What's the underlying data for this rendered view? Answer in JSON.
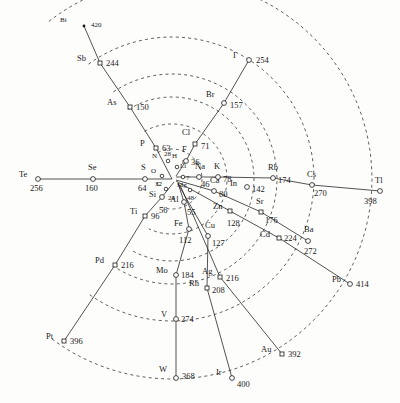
{
  "figure": {
    "type": "radial-spiral-periodic-system",
    "background": "#fdfdfc",
    "ink": "#1b1b1b",
    "width": 400,
    "height": 403,
    "center": {
      "x": 172,
      "y": 179
    }
  },
  "chart_data": {
    "type": "scatter",
    "title": "",
    "xlabel": "",
    "ylabel": "",
    "value_field": "atomic_weight",
    "points": [
      {
        "symbol": "Bi",
        "value": "420",
        "x": 84,
        "y": 26,
        "marker": "dot",
        "size": "tiny",
        "lx": -24,
        "ly": -4,
        "vx": 7,
        "vy": -4
      },
      {
        "symbol": "Sb",
        "value": "244",
        "x": 100,
        "y": 63,
        "marker": "sq",
        "size": "normal",
        "lx": -23,
        "ly": -4,
        "vx": 6,
        "vy": -4
      },
      {
        "symbol": "As",
        "value": "150",
        "x": 130,
        "y": 107,
        "marker": "sq",
        "size": "normal",
        "lx": -23,
        "ly": -4,
        "vx": 6,
        "vy": -4
      },
      {
        "symbol": "P",
        "value": "63",
        "x": 156,
        "y": 148,
        "marker": "sq",
        "size": "normal",
        "lx": -16,
        "ly": -4,
        "vx": 6,
        "vy": -4
      },
      {
        "symbol": "I",
        "value": "254",
        "x": 249,
        "y": 60,
        "marker": "circ",
        "size": "normal",
        "lx": -16,
        "ly": -4,
        "vx": 7,
        "vy": -4
      },
      {
        "symbol": "Br",
        "value": "157",
        "x": 224,
        "y": 103,
        "marker": "circ",
        "size": "normal",
        "lx": -18,
        "ly": -8,
        "vx": 6,
        "vy": -2
      },
      {
        "symbol": "Cl",
        "value": "71",
        "x": 195,
        "y": 144,
        "marker": "sq",
        "size": "normal",
        "lx": -13,
        "ly": -11,
        "vx": 6,
        "vy": -2
      },
      {
        "symbol": "F",
        "value": "36",
        "x": 186,
        "y": 161,
        "marker": "circ",
        "size": "normal",
        "lx": -4,
        "ly": -11,
        "vx": 5,
        "vy": -3
      },
      {
        "symbol": "N",
        "value": "28",
        "x": 168,
        "y": 161,
        "marker": "circ",
        "size": "tiny",
        "lx": -16,
        "ly": -3,
        "vx": -4,
        "vy": -10
      },
      {
        "symbol": "H",
        "value": "1",
        "x": 177,
        "y": 167,
        "marker": "circ",
        "size": "tiny",
        "lx": -5,
        "ly": -9,
        "vx": 4,
        "vy": -8
      },
      {
        "symbol": "Te",
        "value": "256",
        "x": 38,
        "y": 179,
        "marker": "circ",
        "size": "normal",
        "lx": -19,
        "ly": -4,
        "vx": -8,
        "vy": 5
      },
      {
        "symbol": "Se",
        "value": "160",
        "x": 93,
        "y": 179,
        "marker": "circ",
        "size": "normal",
        "lx": -5,
        "ly": -11,
        "vx": -8,
        "vy": 5
      },
      {
        "symbol": "S",
        "value": "64",
        "x": 145,
        "y": 179,
        "marker": "circ",
        "size": "normal",
        "lx": -4,
        "ly": -11,
        "vx": -7,
        "vy": 5
      },
      {
        "symbol": "O",
        "value": "32",
        "x": 162,
        "y": 176,
        "marker": "circ",
        "size": "tiny",
        "lx": -11,
        "ly": -3,
        "vx": -7,
        "vy": 5
      },
      {
        "symbol": "Li",
        "value": "7",
        "x": 183,
        "y": 177,
        "marker": "circ",
        "size": "tiny",
        "lx": -3,
        "ly": -9,
        "vx": 3,
        "vy": -2
      },
      {
        "symbol": "Na",
        "value": "46",
        "x": 199,
        "y": 177,
        "marker": "circ",
        "size": "normal",
        "lx": -4,
        "ly": -10,
        "vx": 2,
        "vy": 3
      },
      {
        "symbol": "K",
        "value": "78",
        "x": 218,
        "y": 177,
        "marker": "circ",
        "size": "normal",
        "lx": -4,
        "ly": -10,
        "vx": 5,
        "vy": -2
      },
      {
        "symbol": "Rb",
        "value": "174",
        "x": 273,
        "y": 178,
        "marker": "circ",
        "size": "normal",
        "lx": -5,
        "ly": -10,
        "vx": 5,
        "vy": -2
      },
      {
        "symbol": "Cs",
        "value": "270",
        "x": 312,
        "y": 185,
        "marker": "circ",
        "size": "normal",
        "lx": -5,
        "ly": -10,
        "vx": 2,
        "vy": 4
      },
      {
        "symbol": "Tl",
        "value": "398",
        "x": 380,
        "y": 191,
        "marker": "circ",
        "size": "normal",
        "lx": -5,
        "ly": -10,
        "vx": -16,
        "vy": 6
      },
      {
        "symbol": "In",
        "value": "142",
        "x": 247,
        "y": 187,
        "marker": "circ",
        "size": "normal",
        "lx": -17,
        "ly": -3,
        "vx": 5,
        "vy": -2
      },
      {
        "symbol": "Ca",
        "value": "80",
        "x": 214,
        "y": 191,
        "marker": "circ",
        "size": "normal",
        "lx": -4,
        "ly": -10,
        "vx": 5,
        "vy": -1
      },
      {
        "symbol": "Mg",
        "value": "48",
        "x": 190,
        "y": 190,
        "marker": "circ",
        "size": "tiny",
        "lx": -13,
        "ly": -3,
        "vx": -3,
        "vy": 5
      },
      {
        "symbol": "C",
        "value": "24",
        "x": 166,
        "y": 189,
        "marker": "circ",
        "size": "tiny",
        "lx": -10,
        "ly": -3,
        "vx": 2,
        "vy": 6
      },
      {
        "symbol": "Si",
        "value": "56",
        "x": 162,
        "y": 197,
        "marker": "circ",
        "size": "normal",
        "lx": -13,
        "ly": -2,
        "vx": -3,
        "vy": 9
      },
      {
        "symbol": "Al",
        "value": "55",
        "x": 184,
        "y": 202,
        "marker": "circ",
        "size": "normal",
        "lx": -14,
        "ly": -2,
        "vx": 3,
        "vy": 6
      },
      {
        "symbol": "Ti",
        "value": "96",
        "x": 145,
        "y": 216,
        "marker": "sq",
        "size": "normal",
        "lx": -15,
        "ly": -4,
        "vx": 6,
        "vy": -4
      },
      {
        "symbol": "Zn",
        "value": "128",
        "x": 230,
        "y": 211,
        "marker": "sq",
        "size": "normal",
        "lx": -17,
        "ly": -4,
        "vx": -3,
        "vy": 8
      },
      {
        "symbol": "Sr",
        "value": "176",
        "x": 261,
        "y": 212,
        "marker": "sq",
        "size": "normal",
        "lx": -5,
        "ly": -10,
        "vx": 4,
        "vy": 4
      },
      {
        "symbol": "Fe",
        "value": "112",
        "x": 189,
        "y": 229,
        "marker": "circ",
        "size": "normal",
        "lx": -15,
        "ly": -5,
        "vx": -10,
        "vy": 7
      },
      {
        "symbol": "Cu",
        "value": "127",
        "x": 208,
        "y": 236,
        "marker": "circ",
        "size": "normal",
        "lx": -3,
        "ly": -10,
        "vx": 4,
        "vy": 3
      },
      {
        "symbol": "Cd",
        "value": "224",
        "x": 279,
        "y": 238,
        "marker": "sq",
        "size": "normal",
        "lx": -19,
        "ly": -3,
        "vx": 5,
        "vy": -4
      },
      {
        "symbol": "Ba",
        "value": "272",
        "x": 308,
        "y": 241,
        "marker": "circ",
        "size": "normal",
        "lx": -4,
        "ly": -11,
        "vx": -4,
        "vy": 6
      },
      {
        "symbol": "Pd",
        "value": "216",
        "x": 115,
        "y": 265,
        "marker": "sq",
        "size": "normal",
        "lx": -20,
        "ly": -4,
        "vx": 6,
        "vy": -4
      },
      {
        "symbol": "Mo",
        "value": "184",
        "x": 176,
        "y": 275,
        "marker": "circ",
        "size": "normal",
        "lx": -20,
        "ly": -4,
        "vx": 5,
        "vy": -4
      },
      {
        "symbol": "Ag",
        "value": "216",
        "x": 220,
        "y": 277,
        "marker": "sq",
        "size": "normal",
        "lx": -18,
        "ly": -5,
        "vx": 6,
        "vy": -3
      },
      {
        "symbol": "Rh",
        "value": "208",
        "x": 207,
        "y": 288,
        "marker": "sq",
        "size": "normal",
        "lx": -18,
        "ly": -4,
        "vx": 5,
        "vy": -2
      },
      {
        "symbol": "Pb",
        "value": "414",
        "x": 350,
        "y": 284,
        "marker": "circ",
        "size": "normal",
        "lx": -18,
        "ly": -4,
        "vx": 6,
        "vy": -4
      },
      {
        "symbol": "V",
        "value": "274",
        "x": 176,
        "y": 319,
        "marker": "circ",
        "size": "normal",
        "lx": -15,
        "ly": -4,
        "vx": 5,
        "vy": -4
      },
      {
        "symbol": "Pt",
        "value": "396",
        "x": 64,
        "y": 341,
        "marker": "sq",
        "size": "normal",
        "lx": -18,
        "ly": -4,
        "vx": 6,
        "vy": -4
      },
      {
        "symbol": "Au",
        "value": "392",
        "x": 282,
        "y": 354,
        "marker": "sq",
        "size": "normal",
        "lx": -21,
        "ly": -4,
        "vx": 6,
        "vy": -4
      },
      {
        "symbol": "W",
        "value": "368",
        "x": 176,
        "y": 378,
        "marker": "circ",
        "size": "normal",
        "lx": -17,
        "ly": -8,
        "vx": 6,
        "vy": -6
      },
      {
        "symbol": "Ir",
        "value": "400",
        "x": 232,
        "y": 378,
        "marker": "circ",
        "size": "normal",
        "lx": -16,
        "ly": -5,
        "vx": 5,
        "vy": 2
      }
    ],
    "radial_lines": [
      {
        "name": "N-P-As-Sb-Bi",
        "points": [
          [
            84,
            26
          ],
          [
            100,
            63
          ],
          [
            130,
            107
          ],
          [
            156,
            148
          ],
          [
            172,
            179
          ]
        ]
      },
      {
        "name": "F-Cl-Br-I",
        "points": [
          [
            249,
            60
          ],
          [
            224,
            103
          ],
          [
            195,
            144
          ],
          [
            186,
            161
          ],
          [
            176,
            176
          ]
        ]
      },
      {
        "name": "O-S-Se-Te",
        "points": [
          [
            38,
            179
          ],
          [
            93,
            179
          ],
          [
            145,
            179
          ],
          [
            172,
            179
          ]
        ]
      },
      {
        "name": "Li-Na-K-Rb-Cs-Tl",
        "points": [
          [
            176,
            177
          ],
          [
            199,
            177
          ],
          [
            218,
            177
          ],
          [
            273,
            178
          ],
          [
            312,
            185
          ],
          [
            380,
            191
          ]
        ]
      },
      {
        "name": "Mg-Ca-Sr-Ba",
        "points": [
          [
            176,
            180
          ],
          [
            214,
            191
          ],
          [
            261,
            212
          ],
          [
            308,
            241
          ]
        ]
      },
      {
        "name": "Zn-Cd-Pb",
        "points": [
          [
            176,
            181
          ],
          [
            230,
            211
          ],
          [
            279,
            238
          ],
          [
            350,
            284
          ]
        ]
      },
      {
        "name": "C-Si-Ti-Pd-Pt",
        "points": [
          [
            174,
            182
          ],
          [
            162,
            197
          ],
          [
            145,
            216
          ],
          [
            115,
            265
          ],
          [
            64,
            341
          ]
        ]
      },
      {
        "name": "Al-Fe-Mo-V-W",
        "points": [
          [
            178,
            183
          ],
          [
            184,
            202
          ],
          [
            189,
            229
          ],
          [
            176,
            275
          ],
          [
            176,
            319
          ],
          [
            176,
            378
          ]
        ]
      },
      {
        "name": "Cu-Rh-Ir",
        "points": [
          [
            178,
            184
          ],
          [
            208,
            236
          ],
          [
            207,
            288
          ],
          [
            232,
            378
          ]
        ]
      },
      {
        "name": "Ag-Au",
        "points": [
          [
            180,
            185
          ],
          [
            220,
            277
          ],
          [
            282,
            354
          ]
        ]
      }
    ],
    "arcs": [
      {
        "name": "period-arc-1",
        "r": 30
      },
      {
        "name": "period-arc-2",
        "r": 55
      },
      {
        "name": "period-arc-3",
        "r": 82
      },
      {
        "name": "period-arc-4",
        "r": 105
      },
      {
        "name": "period-arc-5",
        "r": 142
      },
      {
        "name": "period-arc-6",
        "r": 200
      }
    ]
  }
}
